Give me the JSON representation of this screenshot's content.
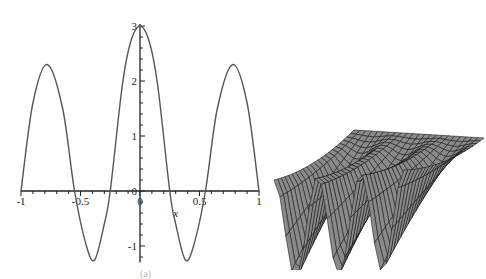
{
  "chart_data": [
    {
      "type": "line",
      "title": "",
      "xlabel": "x",
      "ylabel": "",
      "xlim": [
        -1,
        1
      ],
      "ylim": [
        -1.3,
        3
      ],
      "grid": false,
      "x_ticks": [
        "-1",
        "-0.5",
        "0",
        "0.5",
        "1"
      ],
      "y_ticks": [
        "-1",
        "0",
        "1",
        "2",
        "3"
      ],
      "series": [
        {
          "name": "f(x)",
          "x": [
            -1,
            -0.9,
            -0.78,
            -0.65,
            -0.55,
            -0.45,
            -0.38,
            -0.3,
            -0.25,
            -0.15,
            -0.08,
            0,
            0.08,
            0.15,
            0.25,
            0.3,
            0.38,
            0.45,
            0.55,
            0.65,
            0.78,
            0.9,
            1
          ],
          "y": [
            0,
            1.6,
            2.3,
            1.5,
            0,
            -1.0,
            -1.25,
            -0.6,
            0,
            1.9,
            2.7,
            3,
            2.7,
            1.9,
            0,
            -0.6,
            -1.25,
            -1.0,
            0,
            1.5,
            2.3,
            1.6,
            0
          ]
        }
      ]
    },
    {
      "type": "surface",
      "title": "",
      "description": "3D wireframe surface plot with three sharp peaks along the front edge and a flatter sloping mesh toward the back right",
      "grid": true
    }
  ],
  "caption": "(a)"
}
